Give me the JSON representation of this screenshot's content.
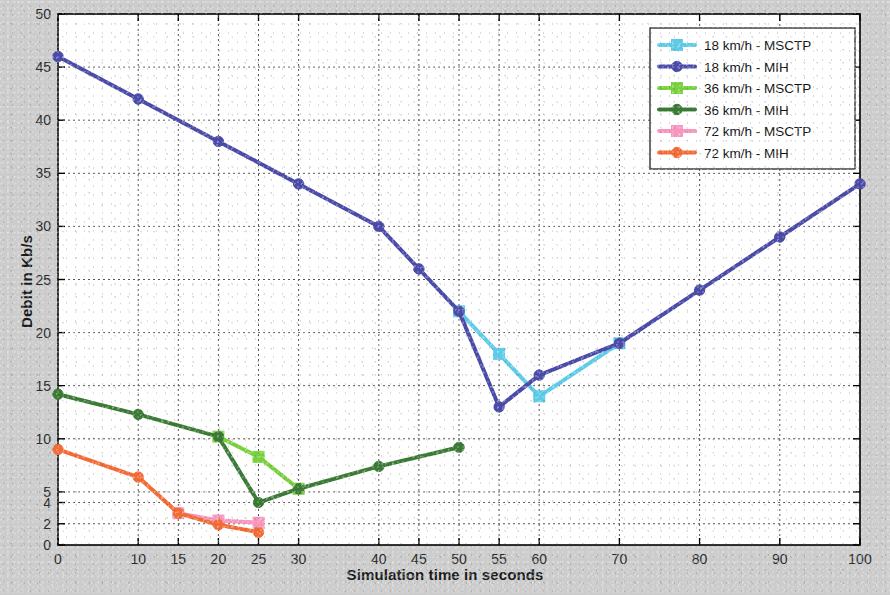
{
  "chart_data": {
    "type": "line",
    "title": "",
    "xlabel": "Simulation time in seconds",
    "ylabel": "Debit in Kb/s",
    "xlim": [
      0,
      100
    ],
    "ylim": [
      0,
      50
    ],
    "grid": true,
    "legend_position": "top-right",
    "xticks": [
      0,
      10,
      15,
      20,
      25,
      30,
      40,
      45,
      50,
      55,
      60,
      70,
      80,
      90,
      100
    ],
    "xtick_labels": [
      "0",
      "10",
      "15",
      "20",
      "25",
      "30",
      "40",
      "45",
      "50",
      "55",
      "60",
      "70",
      "80",
      "90",
      "100"
    ],
    "yticks": [
      0,
      2,
      4,
      5,
      10,
      15,
      20,
      25,
      30,
      35,
      40,
      45,
      50
    ],
    "ytick_labels": [
      "0",
      "2",
      "4",
      "5",
      "10",
      "15",
      "20",
      "25",
      "30",
      "35",
      "40",
      "45",
      "50"
    ],
    "series": [
      {
        "name": "18 km/h - MSCTP",
        "color": "#5DCBE8",
        "marker": "square",
        "x": [
          50,
          55,
          60,
          70
        ],
        "y": [
          22,
          18,
          14,
          19
        ]
      },
      {
        "name": "18 km/h - MIH",
        "color": "#4A4AA8",
        "marker": "circle",
        "x": [
          0,
          10,
          20,
          30,
          40,
          45,
          50,
          55,
          60,
          70,
          80,
          90,
          100
        ],
        "y": [
          46,
          42,
          38,
          34,
          30,
          26,
          22,
          13,
          16,
          19,
          24,
          29,
          34
        ]
      },
      {
        "name": "36 km/h - MSCTP",
        "color": "#78D13C",
        "marker": "square",
        "x": [
          20,
          25,
          30
        ],
        "y": [
          10.2,
          8.3,
          5.3
        ]
      },
      {
        "name": "36 km/h - MIH",
        "color": "#3A7A35",
        "marker": "circle",
        "x": [
          0,
          10,
          20,
          25,
          30,
          40,
          50
        ],
        "y": [
          14.2,
          12.3,
          10.2,
          4,
          5.3,
          7.4,
          9.2
        ]
      },
      {
        "name": "72 km/h - MSCTP",
        "color": "#F795BE",
        "marker": "square",
        "x": [
          15,
          20,
          25
        ],
        "y": [
          3.0,
          2.3,
          2.1
        ]
      },
      {
        "name": "72 km/h - MIH",
        "color": "#F26B35",
        "marker": "circle",
        "x": [
          0,
          10,
          15,
          20,
          25
        ],
        "y": [
          9.0,
          6.4,
          3.0,
          1.9,
          1.2
        ]
      }
    ]
  },
  "figure": {
    "background_color": "#cccccc",
    "plot_background_color": "#ffffff",
    "axis_color": "#000000",
    "grid_color": "#555555"
  }
}
